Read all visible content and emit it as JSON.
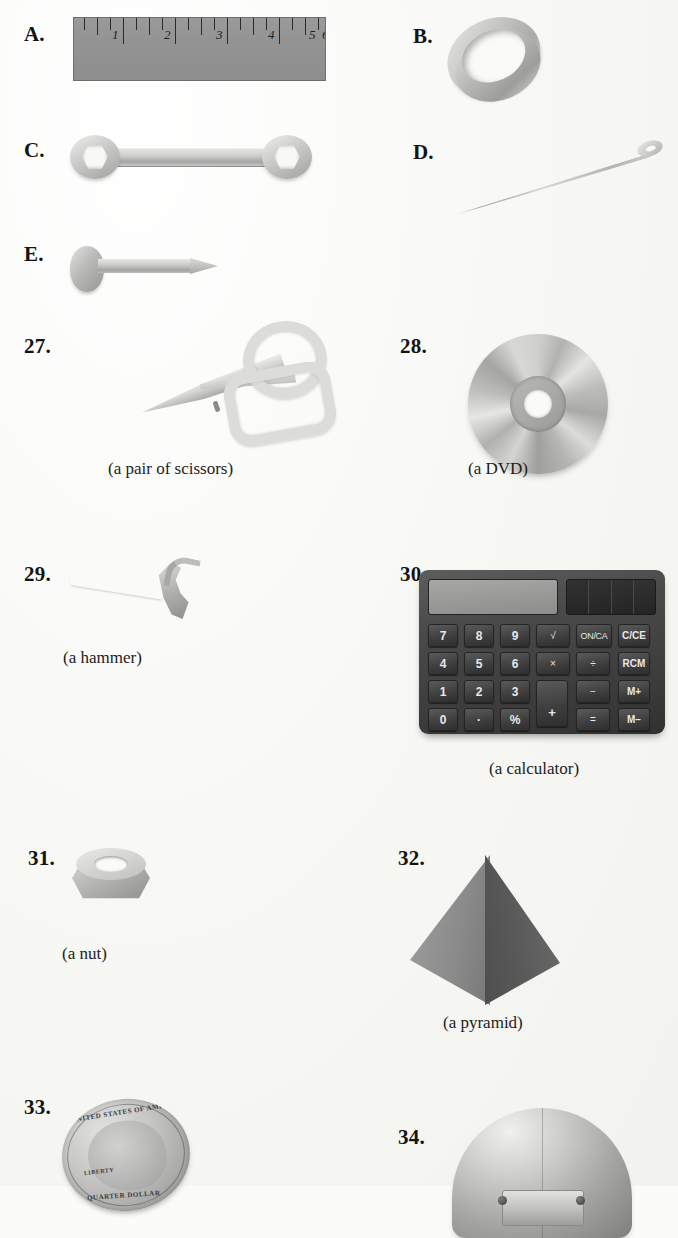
{
  "page": {
    "background_color": "#fbfbf9",
    "ink_color": "#1a1a1a",
    "kind": "workbook-object-identification-page"
  },
  "lettered_items": [
    {
      "label": "A.",
      "object": "ruler",
      "caption": ""
    },
    {
      "label": "B.",
      "object": "ring",
      "caption": ""
    },
    {
      "label": "C.",
      "object": "wrench",
      "caption": ""
    },
    {
      "label": "D.",
      "object": "needle",
      "caption": ""
    },
    {
      "label": "E.",
      "object": "nail",
      "caption": ""
    }
  ],
  "numbered_items": [
    {
      "label": "27.",
      "object": "scissors",
      "caption": "(a pair of scissors)"
    },
    {
      "label": "28.",
      "object": "dvd",
      "caption": "(a DVD)"
    },
    {
      "label": "29.",
      "object": "hammer",
      "caption": "(a hammer)"
    },
    {
      "label": "30.",
      "object": "calculator",
      "caption": "(a calculator)"
    },
    {
      "label": "31.",
      "object": "nut",
      "caption": "(a nut)"
    },
    {
      "label": "32.",
      "object": "pyramid",
      "caption": "(a pyramid)"
    },
    {
      "label": "33.",
      "object": "quarter-coin",
      "caption": ""
    },
    {
      "label": "34.",
      "object": "metal-dome",
      "caption": ""
    }
  ],
  "ruler": {
    "numbers": [
      "1",
      "2",
      "3",
      "4",
      "5",
      "6"
    ],
    "unit": "inches",
    "major_ticks": 6,
    "minor_ticks_per_inch": 3,
    "body_color": "#949494"
  },
  "calculator": {
    "display_value": "",
    "keys": {
      "row1": [
        "7",
        "8",
        "9",
        "√",
        "ON/CA",
        "C/CE"
      ],
      "row2": [
        "4",
        "5",
        "6",
        "×",
        "÷",
        "RCM"
      ],
      "row3": [
        "1",
        "2",
        "3",
        "+",
        "−",
        "M+"
      ],
      "row4": [
        "0",
        "·",
        "%",
        "=",
        "M−"
      ]
    },
    "numeric_keys": [
      "7",
      "8",
      "9",
      "4",
      "5",
      "6",
      "1",
      "2",
      "3",
      "0",
      "·",
      "%"
    ],
    "operator_keys": [
      "√",
      "×",
      "÷",
      "−",
      "=",
      "+"
    ],
    "function_keys": [
      "ON/CA"
    ],
    "memory_keys": [
      "C/CE",
      "RCM",
      "M+",
      "M−"
    ],
    "body_color": "#3d3d3d",
    "key_color": "#3f3f3f",
    "screen_color": "#9a9a98"
  },
  "coin": {
    "legend_top": "UNITED STATES OF AMERICA",
    "legend_left": "LIBERTY",
    "legend_bottom": "QUARTER DOLLAR"
  }
}
